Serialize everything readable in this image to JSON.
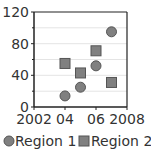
{
  "chart_data": {
    "type": "scatter",
    "title": "",
    "xlabel": "",
    "ylabel": "",
    "xlim": [
      2002,
      2008
    ],
    "ylim": [
      0,
      120
    ],
    "x_ticks": [
      "2002",
      "04",
      "06",
      "2008"
    ],
    "y_ticks": [
      "0",
      "40",
      "80",
      "120"
    ],
    "grid": true,
    "legend_position": "bottom",
    "series": [
      {
        "name": "Region 1",
        "marker": "circle",
        "color": "#808080",
        "points": [
          [
            2004,
            14
          ],
          [
            2005,
            25
          ],
          [
            2006,
            52
          ],
          [
            2007,
            95
          ]
        ]
      },
      {
        "name": "Region 2",
        "marker": "square",
        "color": "#808080",
        "points": [
          [
            2004,
            55
          ],
          [
            2005,
            43
          ],
          [
            2006,
            71
          ],
          [
            2007,
            31
          ]
        ]
      }
    ]
  },
  "legend": {
    "items": [
      {
        "label": "Region 1"
      },
      {
        "label": "Region 2"
      }
    ]
  },
  "axis": {
    "x_labels": [
      "2002",
      "04",
      "06",
      "2008"
    ],
    "y_labels": [
      "0",
      "40",
      "80",
      "120"
    ]
  }
}
